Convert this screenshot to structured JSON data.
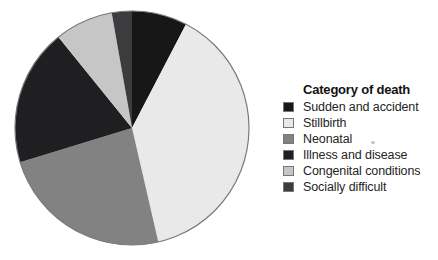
{
  "page": {
    "background_color": "#ffffff"
  },
  "chart_data": {
    "type": "pie",
    "legend_title": "Category of death",
    "legend_position": "right",
    "start_angle_deg": 0,
    "direction": "clockwise",
    "outline_color": "#7a7a7a",
    "slices": [
      {
        "label": "Sudden and accident",
        "color": "#171717",
        "angle_deg": 27.5,
        "value_pct": 7.6
      },
      {
        "label": "Stillbirth",
        "color": "#e9e9e9",
        "angle_deg": 139.5,
        "value_pct": 38.8
      },
      {
        "label": "Neonatal",
        "color": "#828282",
        "angle_deg": 86,
        "value_pct": 23.9
      },
      {
        "label": "Illness and disease",
        "color": "#1f1f21",
        "angle_deg": 68,
        "value_pct": 18.9
      },
      {
        "label": "Congenital conditions",
        "color": "#c6c6c6",
        "angle_deg": 29,
        "value_pct": 8.1
      },
      {
        "label": "Socially difficult",
        "color": "#3c3c3e",
        "angle_deg": 10,
        "value_pct": 2.8
      }
    ]
  }
}
